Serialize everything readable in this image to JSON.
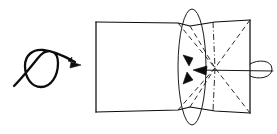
{
  "figure": {
    "title": "Rotation of a rectangular surface into a hyperbolic saddle",
    "canvas": {
      "width": 277,
      "height": 134,
      "background": "#ffffff"
    },
    "colors": {
      "ink": "#0d0d0d",
      "ink_light": "#2b2b2b",
      "background": "#ffffff"
    },
    "elements": [
      {
        "name": "rotation-gesture-symbol",
        "type": "looped-arrow",
        "description": "Curved stroke entering from lower left, looping counter-clockwise into a closed circle, exiting to upper right with a solid arrowhead",
        "loop_center": [
          41,
          70
        ],
        "loop_radius": 16,
        "tail_start": [
          14,
          86
        ],
        "arrow_tip": [
          80,
          64
        ]
      },
      {
        "name": "rectangular-panel",
        "type": "quadrilateral",
        "description": "Flat rectangle forming the left half of the ruled surface",
        "corners": [
          [
            96,
            22
          ],
          [
            190,
            25
          ],
          [
            190,
            109
          ],
          [
            96,
            112
          ]
        ]
      },
      {
        "name": "hyperbolic-panel",
        "type": "bowtie",
        "description": "Pinched saddle region forming the right half of the ruled surface",
        "corners": [
          [
            190,
            25
          ],
          [
            250,
            20
          ],
          [
            250,
            112
          ],
          [
            190,
            109
          ]
        ],
        "waist_x": 190
      },
      {
        "name": "ruling-lines",
        "type": "dashed-lines",
        "description": "Straight generator lines converging at the saddle center",
        "center": [
          215,
          68
        ],
        "count": 8
      },
      {
        "name": "rotation-axis-ellipse-vertical",
        "type": "ellipse",
        "description": "Tall narrow ellipse marking the circular path of the pinched waist",
        "center": [
          192,
          67
        ],
        "rx": 14,
        "ry": 58
      },
      {
        "name": "rotation-axis-ellipse-horizontal",
        "type": "ellipse",
        "description": "Small flat ellipse at the right edge indicating the axis of revolution",
        "center": [
          261,
          70
        ],
        "rx": 12,
        "ry": 8
      },
      {
        "name": "axis-line",
        "type": "line",
        "description": "Horizontal axis of revolution running through the saddle center",
        "from": [
          215,
          68
        ],
        "to": [
          273,
          71
        ]
      },
      {
        "name": "direction-arrow-down",
        "type": "arrowhead",
        "tip": [
          189,
          65
        ],
        "direction": "down"
      },
      {
        "name": "direction-arrow-up",
        "type": "arrowhead",
        "tip": [
          187,
          73
        ],
        "direction": "up"
      },
      {
        "name": "direction-arrow-left",
        "type": "arrowhead",
        "tip": [
          194,
          71
        ],
        "direction": "left"
      }
    ]
  }
}
